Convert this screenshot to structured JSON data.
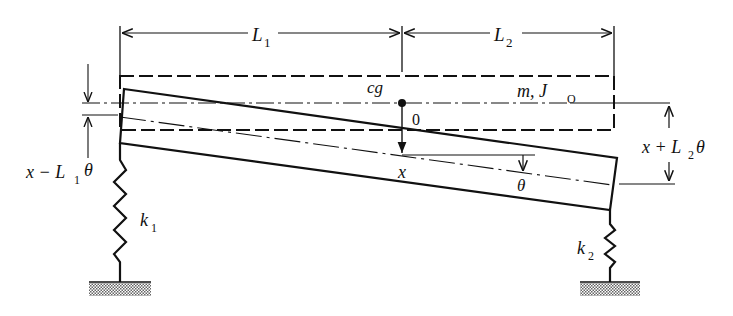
{
  "figure": {
    "type": "two-spring rigid beam (bounce-pitch) model",
    "labels": {
      "L1": "L",
      "L1_sub": "1",
      "L2": "L",
      "L2_sub": "2",
      "cg": "cg",
      "mass": "m, J",
      "mass_sub": "O",
      "origin": "0",
      "x": "x",
      "theta": "θ",
      "left_disp_x": "x − L",
      "left_disp_sub": "1",
      "left_disp_theta": "θ",
      "right_disp_x": "x + L",
      "right_disp_sub": "2",
      "right_disp_theta": "θ",
      "k1": "k",
      "k1_sub": "1",
      "k2": "k",
      "k2_sub": "2"
    },
    "colors": {
      "ink": "#111111",
      "background": "#ffffff",
      "ground_hatch": "#777777"
    }
  }
}
